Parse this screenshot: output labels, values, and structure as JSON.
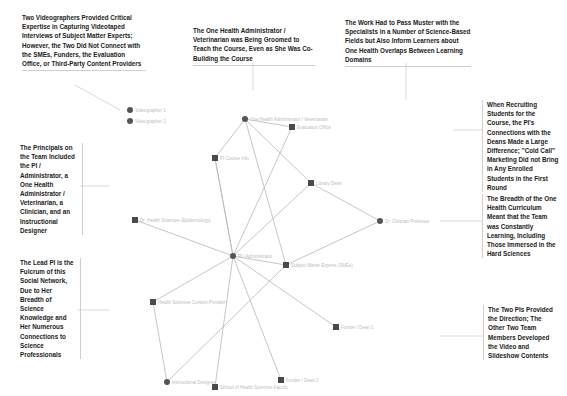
{
  "callouts": {
    "videographers": "Two Videographers Provided Critical Expertise in Capturing Videotaped Interviews of Subject Matter Experts; However, the Two Did Not Connect with the SMEs, Funders, the Evaluation Office, or Third-Party Content Providers",
    "admin_groomed": "The One Health Administrator / Veterinarian was Being Groomed to Teach the Course, Even as She Was Co-Building the Course",
    "pass_muster": "The Work Had to Pass Muster with the Specialists in a Number of Science-Based Fields but Also Inform Learners about One Health Overlaps Between Learning Domains",
    "recruiting": "When Recruiting Students for the Course, the PI's Connections with the Deans Made a Large Difference; \"Cold Call\" Marketing Did not Bring in Any Enrolled Students in the First Round",
    "principals": "The Principals on the Team Included the PI / Administrator, a One Health Administrator / Veterinarian, a Clinician, and an Instructional Designer",
    "breadth": "The Breadth of the One Health Curriculum Meant that the Team was Constantly Learning, Including Those Immersed in the Hard Sciences",
    "lead_pi": "The Lead PI is the Fulcrum of this Social Network, Due to Her Breadth of Science Knowledge and Her Numerous Connections to Science Professionals",
    "two_pis": "The Two PIs Provided the Direction; The Other Two Team Members Developed the Video and Slideshow Contents"
  },
  "network": {
    "nodes": [
      {
        "id": "videographer1",
        "label": "Videographer 1",
        "shape": "circle",
        "x": 130,
        "y": 110
      },
      {
        "id": "videographer2",
        "label": "Videographer 2",
        "shape": "circle",
        "x": 130,
        "y": 121
      },
      {
        "id": "oh_admin",
        "label": "One Health Administrator / Veterinarian",
        "shape": "circle",
        "x": 245,
        "y": 119
      },
      {
        "id": "eval_office",
        "label": "Evaluation Office",
        "shape": "square",
        "x": 292,
        "y": 127
      },
      {
        "id": "course",
        "label": "PI Course Info",
        "shape": "square",
        "x": 215,
        "y": 158
      },
      {
        "id": "library",
        "label": "Library Dean",
        "shape": "square",
        "x": 311,
        "y": 183
      },
      {
        "id": "clinician",
        "label": "Dr. Clinician Professor",
        "shape": "circle",
        "x": 380,
        "y": 221
      },
      {
        "id": "health_sci",
        "label": "Dr. Health Sciences (Epidemiology)",
        "shape": "square",
        "x": 135,
        "y": 220
      },
      {
        "id": "pi",
        "label": "PI / Administrator",
        "shape": "circle",
        "x": 233,
        "y": 256
      },
      {
        "id": "sme",
        "label": "Subject Matter Experts (SMEs)",
        "shape": "square",
        "x": 286,
        "y": 265
      },
      {
        "id": "hs_course",
        "label": "Health Sciences Content Provider",
        "shape": "square",
        "x": 153,
        "y": 302
      },
      {
        "id": "funder1",
        "label": "Funder / Dean 1",
        "shape": "square",
        "x": 336,
        "y": 327
      },
      {
        "id": "designer",
        "label": "Instructional Designer",
        "shape": "circle",
        "x": 167,
        "y": 382
      },
      {
        "id": "oh_faculty",
        "label": "School of Health Sciences Faculty",
        "shape": "square",
        "x": 215,
        "y": 387
      },
      {
        "id": "funder2",
        "label": "Funder / Dean 2",
        "shape": "square",
        "x": 281,
        "y": 380
      }
    ],
    "edges": [
      [
        "pi",
        "course"
      ],
      [
        "pi",
        "eval_office"
      ],
      [
        "pi",
        "library"
      ],
      [
        "pi",
        "sme"
      ],
      [
        "pi",
        "funder1"
      ],
      [
        "pi",
        "funder2"
      ],
      [
        "pi",
        "oh_faculty"
      ],
      [
        "pi",
        "hs_course"
      ],
      [
        "pi",
        "health_sci"
      ],
      [
        "oh_admin",
        "eval_office"
      ],
      [
        "oh_admin",
        "library"
      ],
      [
        "oh_admin",
        "sme"
      ],
      [
        "oh_admin",
        "course"
      ],
      [
        "library",
        "clinician"
      ],
      [
        "clinician",
        "sme"
      ],
      [
        "hs_course",
        "designer"
      ],
      [
        "designer",
        "sme"
      ],
      [
        "course",
        "pi"
      ]
    ],
    "colors": {
      "edge": "#b8b8b8",
      "node": "#4a4a4a",
      "label": "#bdbdbd"
    }
  }
}
